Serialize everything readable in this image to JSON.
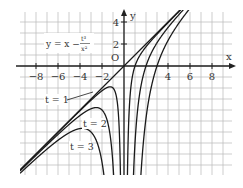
{
  "chart_data": {
    "type": "line",
    "title": "",
    "formula_label": "y = x − t³/x²",
    "formula": {
      "lhs": "y = x − ",
      "num": "t³",
      "den": "x²"
    },
    "xlabel": "x",
    "ylabel": "y",
    "origin_label": "O",
    "xlim": [
      -9.5,
      9.8
    ],
    "ylim": [
      -9.9,
      4.9
    ],
    "grid": true,
    "grid_step": 1,
    "x_ticks": [
      -8,
      -6,
      -4,
      -2,
      4,
      6,
      8
    ],
    "y_ticks": [
      2,
      4
    ],
    "series": [
      {
        "name": "asymptote y = x",
        "t": 0
      },
      {
        "name": "t = 1",
        "t": 1,
        "label": "t = 1"
      },
      {
        "name": "t = 2",
        "t": 2,
        "label": "t = 2"
      },
      {
        "name": "t = 3",
        "t": 3,
        "label": "t = 3"
      }
    ],
    "local_maxima": [
      {
        "t": 1,
        "x": -1.26,
        "y": -1.89
      },
      {
        "t": 2,
        "x": -2.52,
        "y": -3.78
      },
      {
        "t": 3,
        "x": -3.78,
        "y": -5.67
      }
    ],
    "sample_points": {
      "t = 1": {
        "x": [
          -9,
          -6,
          -4,
          -2,
          -1.26,
          -1,
          -0.8,
          0.8,
          1,
          1.5,
          2,
          3,
          4.5
        ],
        "y": [
          -9.01,
          -6.03,
          -4.06,
          -2.25,
          -1.89,
          -2,
          -2.36,
          -0.76,
          0,
          1.06,
          1.75,
          2.89,
          4.45
        ]
      },
      "t = 2": {
        "x": [
          -9,
          -6,
          -4,
          -2.52,
          -2,
          -1.6,
          1.6,
          2,
          3,
          4,
          4.8
        ],
        "y": [
          -9.1,
          -6.22,
          -4.5,
          -3.78,
          -4,
          -4.73,
          -1.53,
          0,
          2.11,
          3.5,
          4.45
        ]
      },
      "t = 3": {
        "x": [
          -9,
          -6,
          -3.78,
          -3,
          -2.5,
          2.5,
          3,
          4,
          5.2
        ],
        "y": [
          -9.33,
          -6.75,
          -5.67,
          -6,
          -6.82,
          -1.82,
          0,
          2.31,
          4.2
        ]
      }
    }
  },
  "layout": {
    "origin_px": [
      124,
      66
    ],
    "unit_px": 11,
    "grid_px": {
      "left": 20,
      "right": 232,
      "top": 12,
      "bottom": 175
    },
    "colors": {
      "grid": "#b8b8b8",
      "axis": "#222222",
      "curve": "#1a1a1a",
      "text": "#333333"
    },
    "series_labels": [
      {
        "text": "t = 1",
        "x": 45,
        "y": 103,
        "leader_to": [
          93,
          92
        ]
      },
      {
        "text": "t = 2",
        "x": 83,
        "y": 127
      },
      {
        "text": "t = 3",
        "x": 70,
        "y": 150
      }
    ]
  }
}
